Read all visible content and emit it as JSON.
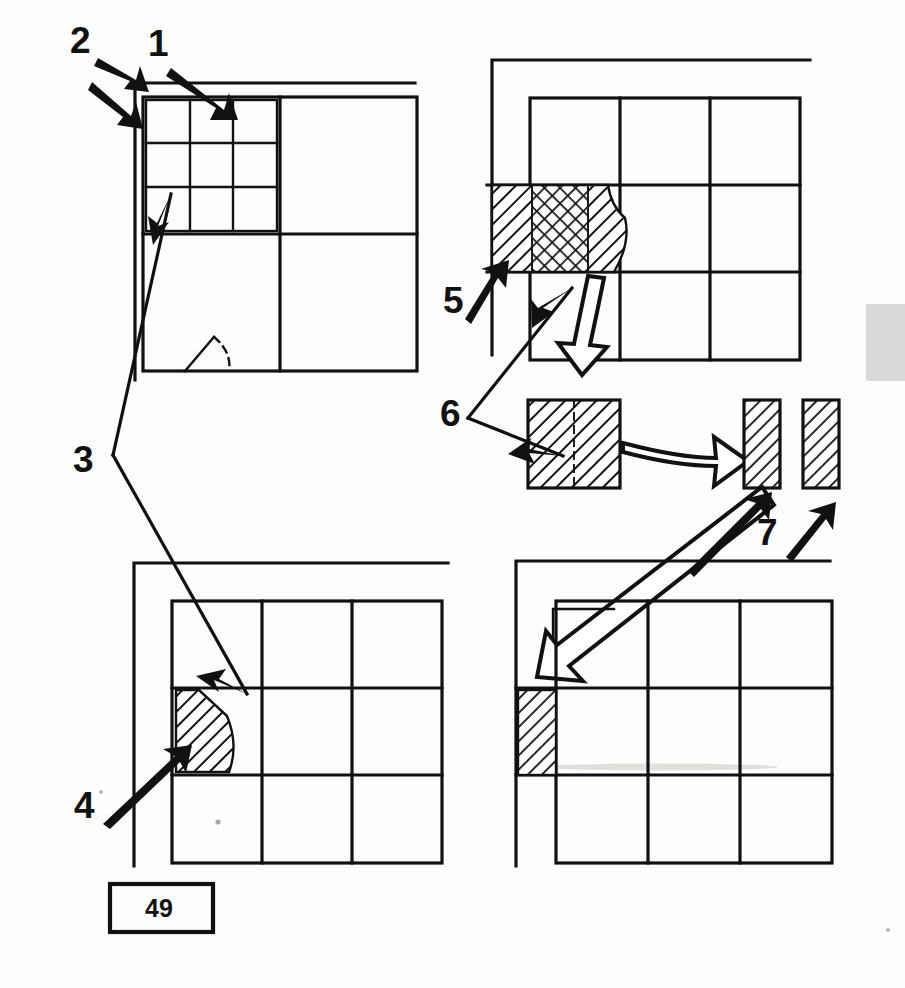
{
  "figure": {
    "page_number_label": "49",
    "ink_color": "#111111",
    "background_color": "#fdfdfb",
    "page_edge_mark_color": "#d9d9d9"
  },
  "callouts": [
    {
      "id": "1",
      "label": "1",
      "x": 148,
      "y": 56,
      "arrow_count": 1,
      "points_to": "panel-top-left-inner-grid-top-edge"
    },
    {
      "id": "2",
      "label": "2",
      "x": 70,
      "y": 53,
      "arrow_count": 2,
      "points_to": "panel-top-left-outer-frame-corner"
    },
    {
      "id": "3",
      "label": "3",
      "x": 73,
      "y": 472,
      "arrow_count": 2,
      "points_to": "panel-top-left-subcell-and-panel-bottom-left-hatched-cell"
    },
    {
      "id": "4",
      "label": "4",
      "x": 74,
      "y": 818,
      "arrow_count": 1,
      "points_to": "panel-bottom-left-hatched-cell-left-edge"
    },
    {
      "id": "5",
      "label": "5",
      "x": 443,
      "y": 313,
      "arrow_count": 1,
      "points_to": "panel-top-right-hatched-band-left"
    },
    {
      "id": "6",
      "label": "6",
      "x": 440,
      "y": 426,
      "arrow_count": 2,
      "points_to": "panel-top-right-hatched-cell-and-detached-square"
    },
    {
      "id": "7",
      "label": "7",
      "x": 757,
      "y": 545,
      "arrow_count": 2,
      "points_to": "detached-strip-left-and-detached-strip-right"
    }
  ],
  "panels": [
    {
      "name": "panel-top-left",
      "description": "Outer frame with large 2x2 grid; top-left quadrant contains a nested 3x3 sub-grid; bottom-left quadrant has a small curved arc detail",
      "grid_rows": 2,
      "grid_cols": 2,
      "sub_grid_rows": 3,
      "sub_grid_cols": 3,
      "hatched_cells": []
    },
    {
      "name": "panel-top-right",
      "description": "Outer frame with 3x3 grid; middle-left cell filled with diagonal hatch, cross-hatch band and a curved boundary",
      "grid_rows": 3,
      "grid_cols": 3,
      "hatched_cells": [
        "middle-left"
      ],
      "fill_patterns": [
        "diagonal-hatch",
        "cross-hatch",
        "diagonal-hatch-curved-edge"
      ]
    },
    {
      "name": "panel-bottom-left",
      "description": "Outer frame with 3x3 grid; middle-left cell diagonally hatched with a curved right boundary",
      "grid_rows": 3,
      "grid_cols": 3,
      "hatched_cells": [
        "middle-left"
      ],
      "fill_patterns": [
        "diagonal-hatch-curved-edge"
      ]
    },
    {
      "name": "panel-bottom-right",
      "description": "Outer frame with 3x3 grid; a narrow diagonally hatched strip sits at the left of the middle row, outside the grid column",
      "grid_rows": 3,
      "grid_cols": 3,
      "hatched_cells": [
        "middle-left-outer-strip"
      ],
      "fill_patterns": [
        "diagonal-hatch"
      ]
    }
  ],
  "detached_elements": [
    {
      "name": "detached-square",
      "description": "Square block, diagonal hatch, split down the middle by a dashed line",
      "fill_pattern": "diagonal-hatch",
      "divider": "dashed-vertical"
    },
    {
      "name": "detached-strip-left",
      "description": "Narrow vertical rectangle, diagonal hatch",
      "fill_pattern": "diagonal-hatch"
    },
    {
      "name": "detached-strip-right",
      "description": "Narrow vertical rectangle, diagonal hatch",
      "fill_pattern": "diagonal-hatch"
    }
  ],
  "flow_arrows": [
    {
      "name": "flow-arrow-down",
      "style": "hollow-outline",
      "direction": "down",
      "from": "panel-top-right-hatched-cell",
      "to": "detached-square"
    },
    {
      "name": "flow-arrow-right",
      "style": "hollow-outline-curved",
      "direction": "right",
      "from": "detached-square",
      "to": "detached-strips"
    },
    {
      "name": "flow-arrow-down-left",
      "style": "hollow-outline-long",
      "direction": "down-left",
      "from": "detached-strips",
      "to": "panel-bottom-right-strip"
    }
  ]
}
